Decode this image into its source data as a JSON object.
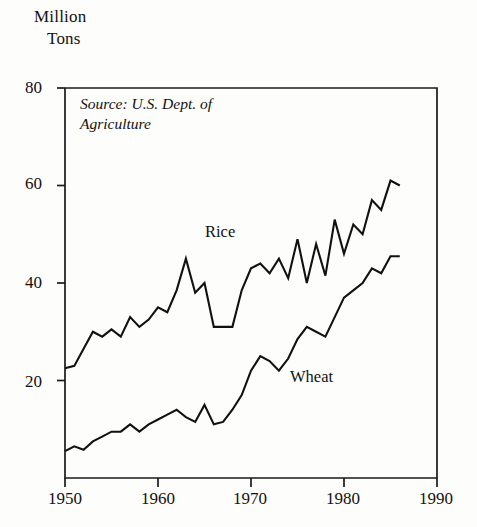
{
  "chart_data": {
    "type": "line",
    "title": "Million Tons",
    "title_lines": [
      "Million",
      "Tons"
    ],
    "xlabel": "",
    "ylabel": "Million Tons",
    "annotation": "Source: U.S. Dept. of Agriculture",
    "xlim": [
      1950,
      1990
    ],
    "ylim": [
      0,
      80
    ],
    "xticks": [
      1950,
      1960,
      1970,
      1980,
      1990
    ],
    "xtick_labels": [
      "1950",
      "1960",
      "1970",
      "1980",
      "1990"
    ],
    "yticks": [
      20,
      40,
      60,
      80
    ],
    "ytick_labels": [
      "20",
      "40",
      "60",
      "80"
    ],
    "grid": false,
    "legend": "inline-labels",
    "series": [
      {
        "name": "Rice",
        "label": "Rice",
        "x": [
          1950,
          1951,
          1952,
          1953,
          1954,
          1955,
          1956,
          1957,
          1958,
          1959,
          1960,
          1961,
          1962,
          1963,
          1964,
          1965,
          1966,
          1967,
          1968,
          1969,
          1970,
          1971,
          1972,
          1973,
          1974,
          1975,
          1976,
          1977,
          1978,
          1979,
          1980,
          1981,
          1982,
          1983,
          1984,
          1985,
          1986
        ],
        "values": [
          22.5,
          23.0,
          26.5,
          30.0,
          29.0,
          30.5,
          29.0,
          33.0,
          31.0,
          32.5,
          35.0,
          34.0,
          38.5,
          45.0,
          38.0,
          40.0,
          31.0,
          31.0,
          31.0,
          38.5,
          43.0,
          44.0,
          42.0,
          45.0,
          41.0,
          49.0,
          40.0,
          48.0,
          41.5,
          53.0,
          46.0,
          52.0,
          50.0,
          57.0,
          55.0,
          61.0,
          60.0
        ]
      },
      {
        "name": "Wheat",
        "label": "Wheat",
        "x": [
          1950,
          1951,
          1952,
          1953,
          1954,
          1955,
          1956,
          1957,
          1958,
          1959,
          1960,
          1961,
          1962,
          1963,
          1964,
          1965,
          1966,
          1967,
          1968,
          1969,
          1970,
          1971,
          1972,
          1973,
          1974,
          1975,
          1976,
          1977,
          1978,
          1979,
          1980,
          1981,
          1982,
          1983,
          1984,
          1985,
          1986
        ],
        "values": [
          5.5,
          6.5,
          5.8,
          7.5,
          8.5,
          9.5,
          9.5,
          11.0,
          9.5,
          11.0,
          12.0,
          13.0,
          14.0,
          12.5,
          11.5,
          15.0,
          11.0,
          11.5,
          14.0,
          17.0,
          22.0,
          25.0,
          24.0,
          22.0,
          24.5,
          28.5,
          31.0,
          30.0,
          29.0,
          33.0,
          37.0,
          38.5,
          40.0,
          43.0,
          42.0,
          45.5,
          45.5
        ]
      }
    ]
  },
  "axes": {
    "y_unit_label_line1": "Million",
    "y_unit_label_line2": "Tons"
  }
}
